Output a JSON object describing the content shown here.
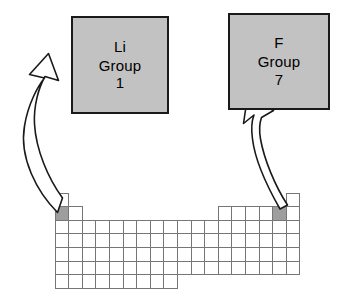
{
  "figure": {
    "type": "diagram",
    "background_color": "#ffffff",
    "line_color": "#1a1a1a",
    "highlight_color": "#9e9e9e",
    "box_fill_color": "#c2c2c2",
    "cell_fill_color": "#ffffff"
  },
  "callouts": [
    {
      "id": "li",
      "element_symbol": "Li",
      "group_label": "Group",
      "group_number": "1",
      "points_to": "lithium-cell"
    },
    {
      "id": "f",
      "element_symbol": "F",
      "group_label": "Group",
      "group_number": "7",
      "points_to": "fluorine-cell"
    }
  ],
  "arrows": [
    {
      "id": "li-arrow",
      "from": "lithium-cell",
      "to": "li-callout-box",
      "style": "curved-hollow-block-arrow"
    },
    {
      "id": "f-arrow",
      "from": "fluorine-cell",
      "to": "f-callout-box",
      "style": "curved-hollow-block-arrow"
    }
  ],
  "periodic_table": {
    "cell_width": 13.6,
    "cell_height": 13.6,
    "origin_x": 55,
    "origin_y": 193,
    "columns": 18,
    "rows": 7,
    "row_spans": [
      [
        [
          1,
          1
        ],
        [
          18,
          18
        ]
      ],
      [
        [
          1,
          2
        ],
        [
          13,
          18
        ]
      ],
      [
        [
          1,
          18
        ]
      ],
      [
        [
          1,
          18
        ]
      ],
      [
        [
          1,
          18
        ]
      ],
      [
        [
          1,
          18
        ]
      ],
      [
        [
          1,
          9
        ]
      ]
    ],
    "highlighted_cells": [
      {
        "name": "lithium-cell",
        "row": 2,
        "column": 1,
        "symbol": "Li"
      },
      {
        "name": "fluorine-cell",
        "row": 2,
        "column": 17,
        "symbol": "F"
      }
    ]
  }
}
